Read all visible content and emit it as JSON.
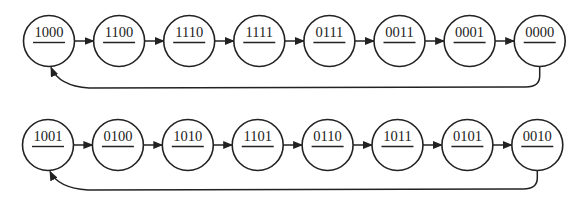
{
  "diagram": {
    "type": "state-transition-cycles",
    "rows": [
      {
        "name": "cycle-1",
        "states": [
          "1000",
          "1100",
          "1110",
          "1111",
          "0111",
          "0011",
          "0001",
          "0000"
        ],
        "feedback": {
          "from": "0000",
          "to": "1000"
        }
      },
      {
        "name": "cycle-2",
        "states": [
          "1001",
          "0100",
          "1010",
          "1101",
          "0110",
          "1011",
          "0101",
          "0010"
        ],
        "feedback": {
          "from": "0010",
          "to": "1001"
        }
      }
    ]
  }
}
